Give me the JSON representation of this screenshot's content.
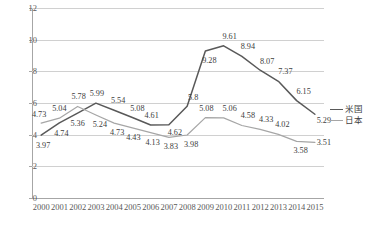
{
  "chart_data": {
    "type": "line",
    "title": "",
    "xlabel": "",
    "ylabel": "",
    "categories": [
      "2000",
      "2001",
      "2002",
      "2003",
      "2004",
      "2005",
      "2006",
      "2007",
      "2008",
      "2009",
      "2010",
      "2011",
      "2012",
      "2013",
      "2014",
      "2015"
    ],
    "ylim": [
      0,
      12
    ],
    "yticks": [
      "0",
      "2",
      "4",
      "6",
      "8",
      "10",
      "12"
    ],
    "grid": true,
    "legend_position": "right",
    "series": [
      {
        "name": "米国",
        "color": "#595959",
        "values": [
          3.97,
          4.74,
          5.36,
          5.99,
          5.54,
          5.08,
          4.61,
          4.62,
          5.8,
          9.28,
          9.61,
          8.94,
          8.07,
          7.37,
          6.15,
          5.29
        ],
        "labels": [
          "3.97",
          "4.74",
          "5.36",
          "5.99",
          "5.54",
          "5.08",
          "4.61",
          "4.62",
          "5.8",
          "9.28",
          "9.61",
          "8.94",
          "8.07",
          "7.37",
          "6.15",
          "5.29"
        ]
      },
      {
        "name": "日本",
        "color": "#a6a6a6",
        "values": [
          4.73,
          5.04,
          5.78,
          5.24,
          4.73,
          4.43,
          4.13,
          3.83,
          3.98,
          5.08,
          5.06,
          4.58,
          4.33,
          4.02,
          3.58,
          3.51
        ],
        "labels": [
          "4.73",
          "5.04",
          "5.78",
          "5.24",
          "4.73",
          "4.43",
          "4.13",
          "3.83",
          "3.98",
          "5.08",
          "5.06",
          "4.58",
          "4.33",
          "4.02",
          "3.58",
          "3.51"
        ]
      }
    ]
  }
}
